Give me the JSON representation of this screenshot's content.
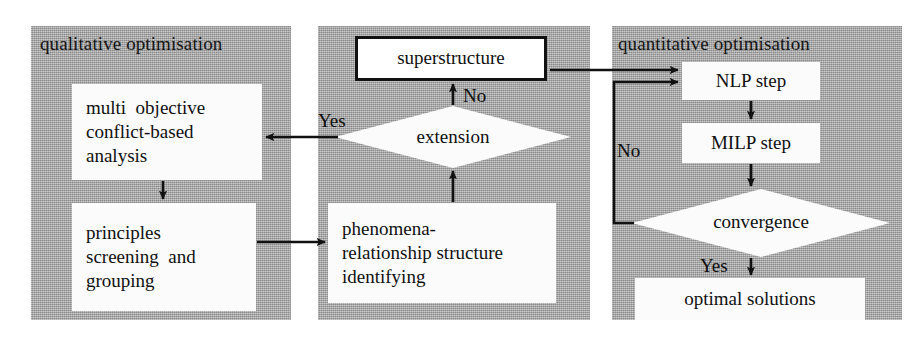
{
  "diagram": {
    "type": "flowchart",
    "panels": [
      {
        "id": "qualitative",
        "label": "qualitative optimisation"
      },
      {
        "id": "middle",
        "label": ""
      },
      {
        "id": "quantitative",
        "label": "quantitative optimisation"
      }
    ],
    "nodes": {
      "multi_objective": {
        "shape": "process",
        "lines": [
          "multi  objective",
          "conflict-based",
          "analysis"
        ]
      },
      "principles": {
        "shape": "process",
        "lines": [
          "principles",
          "screening  and",
          "grouping"
        ]
      },
      "superstructure": {
        "shape": "process-framed",
        "lines": [
          "superstructure"
        ]
      },
      "extension": {
        "shape": "decision",
        "lines": [
          "extension"
        ]
      },
      "phenomena": {
        "shape": "process",
        "lines": [
          "phenomena-",
          "relationship structure",
          "identifying"
        ]
      },
      "nlp_step": {
        "shape": "process",
        "lines": [
          "NLP step"
        ]
      },
      "milp_step": {
        "shape": "process",
        "lines": [
          "MILP step"
        ]
      },
      "convergence": {
        "shape": "decision",
        "lines": [
          "convergence"
        ]
      },
      "optimal_solutions": {
        "shape": "process",
        "lines": [
          "optimal solutions"
        ]
      }
    },
    "edges": [
      {
        "id": "e-multi-principles",
        "from": "multi_objective",
        "to": "principles",
        "label": ""
      },
      {
        "id": "e-principles-phenomena",
        "from": "principles",
        "to": "phenomena",
        "label": ""
      },
      {
        "id": "e-phenomena-extension",
        "from": "phenomena",
        "to": "extension",
        "label": ""
      },
      {
        "id": "e-extension-super",
        "from": "extension",
        "to": "superstructure",
        "label": "No"
      },
      {
        "id": "e-extension-multi",
        "from": "extension",
        "to": "multi_objective",
        "label": "Yes"
      },
      {
        "id": "e-super-nlp",
        "from": "superstructure",
        "to": "nlp_step",
        "label": ""
      },
      {
        "id": "e-nlp-milp",
        "from": "nlp_step",
        "to": "milp_step",
        "label": ""
      },
      {
        "id": "e-milp-convergence",
        "from": "milp_step",
        "to": "convergence",
        "label": ""
      },
      {
        "id": "e-convergence-nlp",
        "from": "convergence",
        "to": "nlp_step",
        "label": "No"
      },
      {
        "id": "e-convergence-optimal",
        "from": "convergence",
        "to": "optimal_solutions",
        "label": "Yes"
      }
    ],
    "edge_labels": {
      "no_extension": "No",
      "yes_extension": "Yes",
      "no_convergence": "No",
      "yes_convergence": "Yes"
    },
    "colors": {
      "panel_fill": "#a8a8a8",
      "box_fill": "#fbfbfb",
      "stroke": "#111111",
      "text": "#101010",
      "background": "#ffffff"
    }
  }
}
